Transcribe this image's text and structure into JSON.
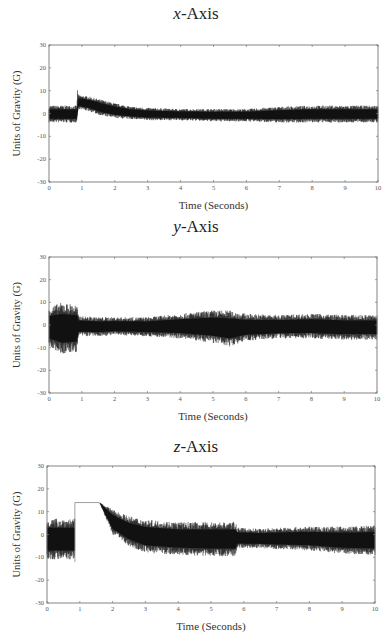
{
  "chart_data": [
    {
      "type": "line",
      "title_var": "x",
      "title_suffix": "-Axis",
      "xlabel": "Time (Seconds)",
      "ylabel": "Units of Gravity (G)",
      "xlim": [
        0,
        10
      ],
      "ylim": [
        -30,
        30
      ],
      "xticks": [
        0,
        1,
        2,
        3,
        4,
        5,
        6,
        7,
        8,
        9,
        10
      ],
      "yticks": [
        30,
        20,
        10,
        0,
        -10,
        -20,
        -30
      ],
      "grid": false,
      "legend": null,
      "series": [
        {
          "name": "x-axis acceleration",
          "color": "#111111",
          "envelope": {
            "t": [
              0.0,
              0.85,
              0.86,
              0.9,
              1.2,
              1.6,
              2.0,
              2.5,
              3.0,
              4.0,
              5.0,
              6.0,
              7.0,
              8.0,
              9.0,
              10.0
            ],
            "upper": [
              3.5,
              3.5,
              11.0,
              8.0,
              7.5,
              6.0,
              4.5,
              3.0,
              2.5,
              2.0,
              2.0,
              2.0,
              3.0,
              3.5,
              3.5,
              3.5
            ],
            "lower": [
              -4.0,
              -4.0,
              -1.0,
              2.0,
              1.0,
              -1.0,
              -2.0,
              -2.5,
              -3.0,
              -3.0,
              -3.5,
              -3.5,
              -4.0,
              -4.0,
              -4.0,
              -4.0
            ]
          }
        }
      ]
    },
    {
      "type": "line",
      "title_var": "y",
      "title_suffix": "-Axis",
      "xlabel": "Time (Seconds)",
      "ylabel": "Units of Gravity (G)",
      "xlim": [
        0,
        10
      ],
      "ylim": [
        -30,
        30
      ],
      "xticks": [
        0,
        1,
        2,
        3,
        4,
        5,
        6,
        7,
        8,
        9,
        10
      ],
      "yticks": [
        30,
        20,
        10,
        0,
        -10,
        -20,
        -30
      ],
      "grid": false,
      "legend": null,
      "series": [
        {
          "name": "y-axis acceleration",
          "color": "#111111",
          "envelope": {
            "t": [
              0.0,
              0.4,
              0.85,
              0.9,
              1.5,
              2.0,
              3.0,
              4.0,
              5.0,
              5.5,
              6.0,
              7.0,
              8.0,
              9.0,
              10.0
            ],
            "upper": [
              8.0,
              10.0,
              9.0,
              4.0,
              3.5,
              3.5,
              3.5,
              5.0,
              6.5,
              6.5,
              5.0,
              4.5,
              5.0,
              4.5,
              4.5
            ],
            "lower": [
              -10.0,
              -13.0,
              -12.0,
              -5.0,
              -5.0,
              -4.5,
              -5.0,
              -6.0,
              -8.0,
              -9.5,
              -7.0,
              -6.0,
              -6.0,
              -6.5,
              -6.5
            ]
          }
        }
      ]
    },
    {
      "type": "line",
      "title_var": "z",
      "title_suffix": "-Axis",
      "xlabel": "Time (Seconds)",
      "ylabel": "Units of Gravity (G)",
      "xlim": [
        0,
        10
      ],
      "ylim": [
        -30,
        30
      ],
      "xticks": [
        0,
        1,
        2,
        3,
        4,
        5,
        6,
        7,
        8,
        9,
        10
      ],
      "yticks": [
        30,
        20,
        10,
        0,
        -10,
        -20,
        -30
      ],
      "grid": false,
      "legend": null,
      "saturation": {
        "t_start": 0.85,
        "t_end": 1.6,
        "value": 14
      },
      "series": [
        {
          "name": "z-axis acceleration",
          "color": "#111111",
          "envelope": {
            "t": [
              0.0,
              0.84,
              1.6,
              2.0,
              2.5,
              3.0,
              4.0,
              5.0,
              5.75,
              5.8,
              6.5,
              7.0,
              8.0,
              9.0,
              10.0
            ],
            "upper": [
              7.0,
              7.0,
              14.0,
              11.0,
              8.0,
              6.5,
              5.5,
              5.5,
              5.5,
              3.0,
              2.5,
              3.0,
              3.5,
              3.5,
              4.0
            ],
            "lower": [
              -11.0,
              -11.0,
              14.0,
              0.0,
              -5.0,
              -8.0,
              -9.0,
              -9.5,
              -9.5,
              -6.0,
              -6.0,
              -6.5,
              -7.0,
              -8.5,
              -9.0
            ]
          }
        }
      ]
    }
  ],
  "panels": [
    {
      "title_var": "x",
      "title_suffix": "-Axis",
      "xlabel": "Time (Seconds)",
      "ylabel": "Units of Gravity (G)"
    },
    {
      "title_var": "y",
      "title_suffix": "-Axis",
      "xlabel": "Time (Seconds)",
      "ylabel": "Units of Gravity (G)"
    },
    {
      "title_var": "z",
      "title_suffix": "-Axis",
      "xlabel": "Time (Seconds)",
      "ylabel": "Units of Gravity (G)"
    }
  ]
}
